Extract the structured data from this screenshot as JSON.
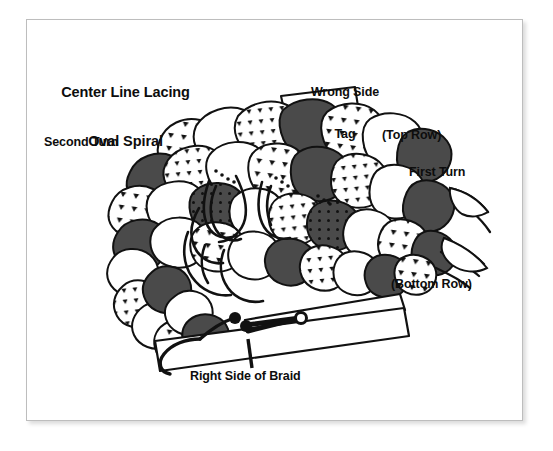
{
  "page": {
    "background_color": "#ffffff",
    "sheet_color": "#ffffff",
    "border_color": "#bdbdbd"
  },
  "diagram": {
    "title_line1": "Center Line Lacing",
    "title_line2": "Oval Spiral",
    "ink_color": "#0d0d0d",
    "strand_dark_color": "#4a4a4a",
    "strand_light_color": "#ffffff"
  },
  "labels": {
    "second_turn": "Second Turn",
    "wrong_side_tag_line1": "Wrong Side",
    "wrong_side_tag_line2": "Tag",
    "top_row": "(Top Row)",
    "first_turn": "First Turn",
    "bottom_row": "(Bottom Row)",
    "right_side_of_braid": "Right Side of Braid"
  },
  "elements": {
    "tag_shape": "wrong-side-tag",
    "clothespin": "clothespin",
    "braid": "oval-spiral-braid",
    "lacing_cord": "lacing-cord"
  }
}
